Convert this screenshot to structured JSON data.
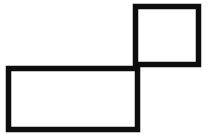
{
  "canvas": {
    "width": 210,
    "height": 138,
    "background_color": "#ffffff",
    "title": "Two overlapping rectangles forming an L-shaped outline figure"
  },
  "style": {
    "stroke_color": "#0d0d0d",
    "stroke_width": 5.5,
    "fill": "none"
  },
  "shapes": [
    {
      "name": "upper-right-square",
      "type": "rectangle",
      "label": "Small square (top right)",
      "x": 135.5,
      "y": 6.5,
      "width": 63,
      "height": 58,
      "stroke_color": "#0d0d0d",
      "stroke_width": 5.5
    },
    {
      "name": "lower-left-rectangle",
      "type": "rectangle",
      "label": "Wide rectangle (bottom left)",
      "x": 8.5,
      "y": 68.5,
      "width": 129,
      "height": 61,
      "stroke_color": "#0d0d0d",
      "stroke_width": 5.5
    }
  ],
  "intersection": {
    "name": "corner-junction",
    "label": "Cross junction where the square's left edge meets the rectangle's top edge",
    "x": 137,
    "y": 68
  }
}
